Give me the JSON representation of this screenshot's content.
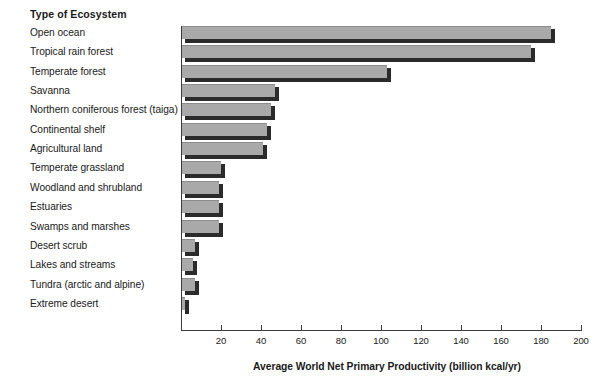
{
  "chart_data": {
    "type": "bar",
    "orientation": "horizontal",
    "title": "",
    "category_header": "Type of Ecosystem",
    "xlabel": "Average World Net Primary Productivity (billion kcal/yr)",
    "ylabel": "Type of Ecosystem",
    "xlim": [
      0,
      200
    ],
    "xticks": [
      20,
      40,
      60,
      80,
      100,
      120,
      140,
      160,
      180,
      200
    ],
    "xtick_labels": [
      "20",
      "40",
      "60",
      "80",
      "100",
      "120",
      "140",
      "160",
      "180",
      "200"
    ],
    "grid": false,
    "legend": "none",
    "bar_fill_color": "#a9a9a9",
    "bar_shadow_color": "#2b2b2b",
    "background_color": "#ffffff",
    "categories": [
      "Open ocean",
      "Tropical rain forest",
      "Temperate forest",
      "Savanna",
      "Northern coniferous forest (taiga)",
      "Continental shelf",
      "Agricultural land",
      "Temperate grassland",
      "Woodland and shrubland",
      "Estuaries",
      "Swamps and marshes",
      "Desert scrub",
      "Lakes and streams",
      "Tundra (arctic and alpine)",
      "Extreme desert"
    ],
    "values": [
      185,
      175,
      103,
      47,
      45,
      43,
      41,
      20,
      19,
      19,
      19,
      7,
      6,
      7,
      2
    ]
  }
}
